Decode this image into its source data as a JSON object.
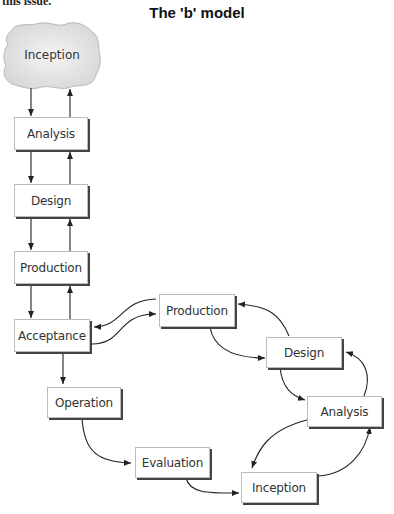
{
  "page": {
    "cut_text": "this issue.",
    "title": "The 'b' model"
  },
  "diagram": {
    "left_column": {
      "cloud": "Inception",
      "boxes": [
        "Analysis",
        "Design",
        "Production",
        "Acceptance",
        "Operation",
        "Evaluation"
      ]
    },
    "loop": {
      "boxes": [
        "Production",
        "Design",
        "Analysis",
        "Inception"
      ]
    },
    "colors": {
      "cloud_fill": "#e4e4e4",
      "box_border": "#bbbbbb",
      "shadow": "#444444",
      "arrow": "#222222"
    }
  }
}
